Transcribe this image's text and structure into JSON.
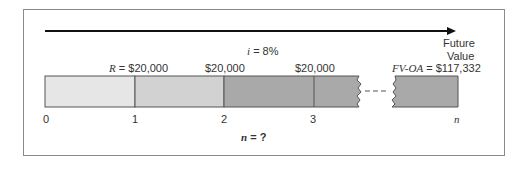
{
  "diagram": {
    "type": "timeline",
    "interest_rate_label": "i = 8%",
    "interest_symbol": "i",
    "interest_value": "= 8%",
    "future_value_label_line1": "Future",
    "future_value_label_line2": "Value",
    "fv_symbol": "FV-OA",
    "fv_value": "= $117,332",
    "payment_symbol": "R",
    "payment_first": "= $20,000",
    "payments": [
      "$20,000",
      "$20,000"
    ],
    "periods": [
      "0",
      "1",
      "2",
      "3",
      "n"
    ],
    "unknown_symbol": "n",
    "unknown_value": "= ?",
    "colors": {
      "segment_1": "#e6e6e6",
      "segment_2": "#d2d2d2",
      "segment_3": "#a9a9a9",
      "segment_n": "#a9a9a9",
      "outline": "#555555",
      "arrow": "#111111"
    }
  }
}
